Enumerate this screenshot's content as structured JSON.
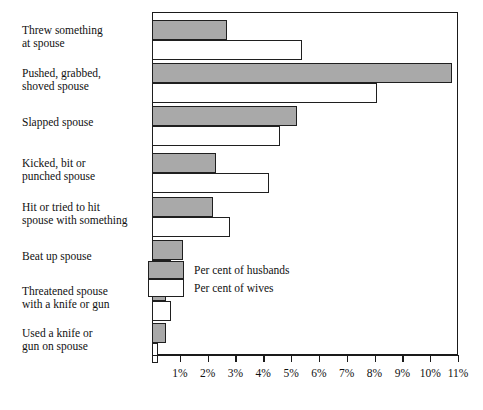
{
  "chart_data": {
    "type": "bar",
    "orientation": "horizontal",
    "title": "",
    "xlabel": "",
    "ylabel": "",
    "xlim": [
      0,
      11
    ],
    "xunit": "%",
    "grid": false,
    "legend_position": "inside-bottom-center",
    "tick_labels": [
      "1%",
      "2%",
      "3%",
      "4%",
      "5%",
      "6%",
      "7%",
      "8%",
      "9%",
      "10%",
      "11%"
    ],
    "tick_values": [
      1,
      2,
      3,
      4,
      5,
      6,
      7,
      8,
      9,
      10,
      11
    ],
    "categories": [
      "Threw something\nat spouse",
      "Pushed, grabbed,\nshoved spouse",
      "Slapped spouse",
      "Kicked, bit or\npunched spouse",
      "Hit or tried to hit\nspouse with something",
      "Beat up spouse",
      "Threatened spouse\nwith a knife or gun",
      "Used a knife or\ngun on spouse"
    ],
    "series": [
      {
        "name": "Per cent of husbands",
        "color": "#a9a9a9",
        "values": [
          2.7,
          10.8,
          5.2,
          2.3,
          2.2,
          1.1,
          0.5,
          0.5
        ]
      },
      {
        "name": "Per cent of wives",
        "color": "#ffffff",
        "values": [
          5.4,
          8.1,
          4.6,
          4.2,
          2.8,
          0.7,
          0.7,
          0.2
        ]
      }
    ]
  },
  "legend": {
    "entries": [
      {
        "label": "Per cent of husbands",
        "swatch": "husbands"
      },
      {
        "label": "Per cent of wives",
        "swatch": "wives"
      }
    ]
  },
  "colors": {
    "husbands_fill": "#a9a9a9",
    "wives_fill": "#ffffff",
    "outline": "#1f1f1f",
    "background": "#ffffff",
    "text": "#111111"
  }
}
